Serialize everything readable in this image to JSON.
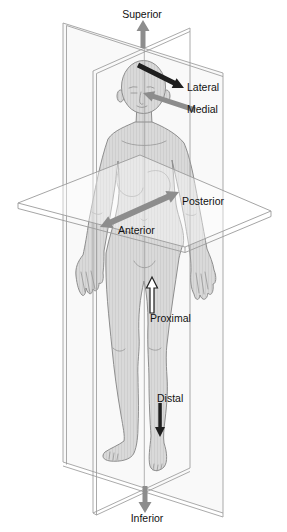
{
  "figure": {
    "labels": {
      "superior": "Superior",
      "lateral": "Lateral",
      "medial": "Medial",
      "posterior": "Posterior",
      "anterior": "Anterior",
      "proximal": "Proximal",
      "distal": "Distal",
      "inferior": "Inferior"
    },
    "arrows": [
      {
        "name": "superior-arrow",
        "label": "Superior",
        "direction": "up",
        "style": "gray-solid"
      },
      {
        "name": "lateral-arrow",
        "label": "Lateral",
        "direction": "outward-right",
        "style": "black-solid"
      },
      {
        "name": "medial-arrow",
        "label": "Medial",
        "direction": "inward-left",
        "style": "gray-solid"
      },
      {
        "name": "posterior-anterior-arrow",
        "label": "Posterior / Anterior",
        "direction": "double-headed-diagonal",
        "style": "gray-solid"
      },
      {
        "name": "proximal-arrow",
        "label": "Proximal",
        "direction": "up",
        "style": "white-outlined"
      },
      {
        "name": "distal-arrow",
        "label": "Distal",
        "direction": "down",
        "style": "black-solid"
      },
      {
        "name": "inferior-arrow",
        "label": "Inferior",
        "direction": "down",
        "style": "gray-solid"
      }
    ],
    "colors": {
      "background": "#ffffff",
      "body_fill": "#d9d9d9",
      "body_outline": "#8e8e8e",
      "plane_stroke": "#9b9b9b",
      "gray_arrow": "#8d8d8d",
      "black_arrow": "#1f1f1f",
      "label_text": "#111111"
    }
  }
}
